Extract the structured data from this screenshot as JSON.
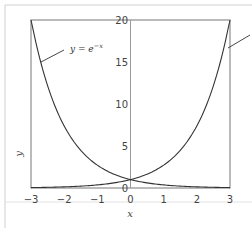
{
  "chart_data": {
    "type": "line",
    "title": "",
    "xlabel": "x",
    "ylabel": "y",
    "xlim": [
      -3,
      3
    ],
    "ylim": [
      0,
      20
    ],
    "x_ticks": [
      "−3",
      "−2",
      "−1",
      "0",
      "1",
      "2",
      "3"
    ],
    "y_ticks": [
      "0",
      "5",
      "10",
      "15",
      "20"
    ],
    "grid": false,
    "series": [
      {
        "name": "y = e^-x",
        "function": "exp(-x)",
        "x": [
          -3,
          -2.5,
          -2,
          -1.5,
          -1,
          -0.5,
          0,
          0.5,
          1,
          1.5,
          2,
          2.5,
          3
        ],
        "values": [
          20.09,
          12.18,
          7.39,
          4.48,
          2.72,
          1.65,
          1.0,
          0.61,
          0.37,
          0.22,
          0.14,
          0.08,
          0.05
        ]
      },
      {
        "name": "y = e^x",
        "function": "exp(x)",
        "x": [
          -3,
          -2.5,
          -2,
          -1.5,
          -1,
          -0.5,
          0,
          0.5,
          1,
          1.5,
          2,
          2.5,
          3
        ],
        "values": [
          0.05,
          0.08,
          0.14,
          0.22,
          0.37,
          0.61,
          1.0,
          1.65,
          2.72,
          4.48,
          7.39,
          12.18,
          20.09
        ]
      }
    ],
    "annotations": [
      {
        "text_main": "y = e",
        "text_sup": "−x",
        "target_series": "y = e^-x"
      }
    ]
  },
  "labels": {
    "annotation_main": "y = e",
    "annotation_sup": "−x",
    "xlabel": "x",
    "ylabel": "y"
  }
}
